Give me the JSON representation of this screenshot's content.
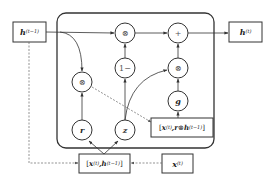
{
  "diagram": {
    "type": "GRU cell",
    "colors": {
      "line": "#333333",
      "dashed": "#777777",
      "background": "#ffffff"
    },
    "inputs": {
      "h_prev": {
        "base": "h",
        "sup": "(t−1)"
      },
      "x_t": {
        "base": "x",
        "sup": "(t)"
      }
    },
    "outputs": {
      "h_t": {
        "base": "h",
        "sup": "(t)"
      }
    },
    "concat_boxes": {
      "xh": {
        "open": "[",
        "x": "x",
        "x_sup": "(t)",
        "sep": ",",
        "h": "h",
        "h_sup": "(t−1)",
        "close": "]"
      },
      "xrh": {
        "open": "[",
        "x": "x",
        "x_sup": "(t)",
        "sep": ",",
        "r": "r",
        "op": "⊗",
        "h": "h",
        "h_sup": "(t−1)",
        "close": "]"
      }
    },
    "nodes": {
      "r": "r",
      "z": "z",
      "g": "g",
      "one_minus": "1−",
      "mult_left": "⊗",
      "mult_top": "⊗",
      "mult_right": "⊗",
      "plus": "+"
    }
  }
}
